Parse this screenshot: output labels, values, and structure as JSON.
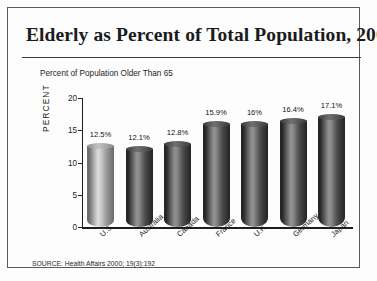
{
  "title": "Elderly as Percent of Total Population, 2000",
  "subtitle": "Percent of Population Older Than 65",
  "source": "SOURCE: Health Affairs 2000; 19(3):192",
  "axis": {
    "y_caption": "PERCENT",
    "y_ticks": [
      "0",
      "5",
      "10",
      "15",
      "20"
    ]
  },
  "chart_data": {
    "type": "bar",
    "title": "Elderly as Percent of Total Population, 2000",
    "subtitle": "Percent of Population Older Than 65",
    "xlabel": "",
    "ylabel": "PERCENT",
    "ylim": [
      0,
      20
    ],
    "yticks": [
      0,
      5,
      10,
      15,
      20
    ],
    "grid": false,
    "legend": "none",
    "categories": [
      "U.S.",
      "Australia",
      "Canada",
      "France",
      "U.K.",
      "Germany",
      "Japan"
    ],
    "values": [
      12.5,
      12.1,
      12.8,
      15.9,
      16.0,
      16.4,
      17.1
    ],
    "data_labels": [
      "12.5%",
      "12.1%",
      "12.8%",
      "15.9%",
      "16%",
      "16.4%",
      "17.1%"
    ],
    "source": "SOURCE: Health Affairs 2000; 19(3):192",
    "bar_colors": [
      "#9a9a9a",
      "#4a4a4a",
      "#4a4a4a",
      "#4a4a4a",
      "#4a4a4a",
      "#4a4a4a",
      "#4a4a4a"
    ]
  }
}
